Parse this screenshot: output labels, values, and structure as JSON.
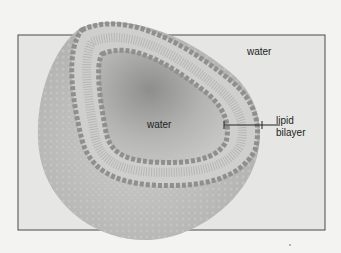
{
  "diagram": {
    "type": "liposome cross-section",
    "labels": {
      "outer_water": "water",
      "inner_water": "water",
      "bilayer_line1": "lipid",
      "bilayer_line2": "bilayer"
    },
    "colors": {
      "background": "#f3f3f1",
      "box_fill": "#e6e6e4",
      "box_border": "#4a4a4a",
      "head_group": "#9a9a98",
      "tail": "#c8c8c6",
      "sphere_surface": "#c4c4c2",
      "interior": "#a8a8a6"
    }
  }
}
